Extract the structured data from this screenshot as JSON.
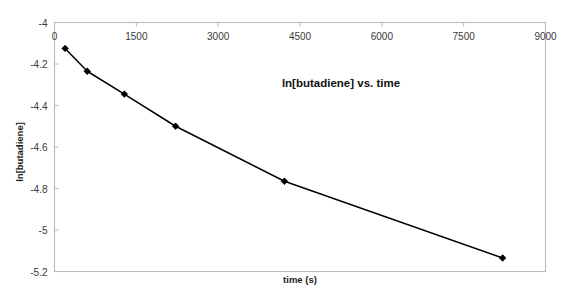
{
  "chart_data": {
    "type": "line",
    "title": "ln[butadiene] vs. time",
    "xlabel": "time (s)",
    "ylabel": "ln[butadiene]",
    "xlim": [
      0,
      9000
    ],
    "ylim": [
      -5.2,
      -4.0
    ],
    "xticks": [
      0,
      1500,
      3000,
      4500,
      6000,
      7500,
      9000
    ],
    "xtick_labels": [
      "0",
      "1500",
      "3000",
      "4500",
      "6000",
      "7500",
      "9000"
    ],
    "yticks": [
      -4,
      -4.2,
      -4.4,
      -4.6,
      -4.8,
      -5,
      -5.2
    ],
    "ytick_labels": [
      "-4",
      "-4.2",
      "-4.4",
      "-4.6",
      "-4.8",
      "-5",
      "-5.2"
    ],
    "grid": false,
    "legend": false,
    "x_axis_position": "top",
    "marker": "filled-diamond",
    "line_color": "#000000",
    "frame_color": "#b9b9b9",
    "x": [
      195,
      600,
      1280,
      2220,
      4215,
      8215
    ],
    "y": [
      -4.125,
      -4.235,
      -4.345,
      -4.5,
      -4.765,
      -5.135
    ],
    "series": [
      {
        "name": "ln[butadiene]",
        "points": [
          {
            "x": 195,
            "y": -4.125
          },
          {
            "x": 600,
            "y": -4.235
          },
          {
            "x": 1280,
            "y": -4.345
          },
          {
            "x": 2220,
            "y": -4.5
          },
          {
            "x": 4215,
            "y": -4.765
          },
          {
            "x": 8215,
            "y": -5.135
          }
        ]
      }
    ]
  },
  "labels": {
    "title": "ln[butadiene] vs. time",
    "x_axis_title": "time (s)",
    "y_axis_title": "ln[butadiene]"
  }
}
